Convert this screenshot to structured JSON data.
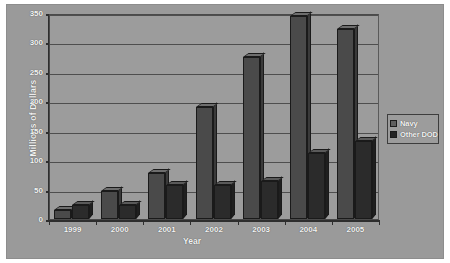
{
  "chart_data": {
    "type": "bar",
    "title": "",
    "subtitle": "",
    "xlabel": "Year",
    "ylabel": "Millions of Dollars",
    "categories": [
      "1999",
      "2000",
      "2001",
      "2002",
      "2003",
      "2004",
      "2005"
    ],
    "series": [
      {
        "name": "Navy",
        "values": [
          16,
          48,
          78,
          190,
          276,
          345,
          322
        ],
        "color": "#4a4a4a"
      },
      {
        "name": "Other DOD",
        "values": [
          23,
          23,
          57,
          57,
          65,
          112,
          133
        ],
        "color": "#2b2b2b"
      }
    ],
    "ylim": [
      0,
      350
    ],
    "ytick_values": [
      0,
      50,
      100,
      150,
      200,
      250,
      300,
      350
    ],
    "ytick_labels": [
      "0",
      "50",
      "100",
      "150",
      "200",
      "250",
      "300",
      "350"
    ],
    "grid": true,
    "grid_axis": "y",
    "legend_position": "right",
    "bar_style": "3d-clustered",
    "plot_background": "#9c9c9c",
    "canvas_background": "#9a9a9a",
    "text_color": "#f5f5f5"
  },
  "legend": {
    "items": [
      {
        "label": "Navy",
        "swatch": "navy-swatch"
      },
      {
        "label": "Other DOD",
        "swatch": "other-dod-swatch"
      }
    ]
  },
  "axes": {
    "y_title": "Millions of Dollars",
    "x_title": "Year"
  }
}
